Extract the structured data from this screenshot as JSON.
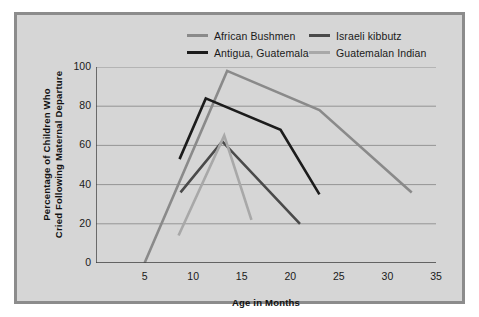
{
  "figure": {
    "background_color": "#d6d6d6",
    "border_color": "#8c8c8c",
    "page_color": "#ffffff"
  },
  "legend": {
    "position": "top-center",
    "entries": [
      {
        "label": "African Bushmen",
        "color": "#8a8a8a"
      },
      {
        "label": "Israeli kibbutz",
        "color": "#4a4a4a"
      },
      {
        "label": "Antigua, Guatemala",
        "color": "#1c1c1c"
      },
      {
        "label": "Guatemalan Indian",
        "color": "#a8a8a8"
      }
    ]
  },
  "axes": {
    "x": {
      "title": "Age in Months",
      "ticks": [
        "5",
        "10",
        "15",
        "20",
        "25",
        "30",
        "35"
      ],
      "min": 0,
      "max": 35
    },
    "y": {
      "title_line1": "Percentage of Children Who",
      "title_line2": "Cried Following Maternal Departure",
      "ticks": [
        "0",
        "20",
        "40",
        "60",
        "80",
        "100"
      ],
      "min": 0,
      "max": 100
    }
  },
  "chart_data": {
    "type": "line",
    "title": "",
    "xlabel": "Age in Months",
    "ylabel": "Percentage of Children Who Cried Following Maternal Departure",
    "xlim": [
      0,
      35
    ],
    "ylim": [
      0,
      100
    ],
    "xticks": [
      5,
      10,
      15,
      20,
      25,
      30,
      35
    ],
    "yticks": [
      0,
      20,
      40,
      60,
      80,
      100
    ],
    "grid": "horizontal",
    "legend_position": "top-center",
    "series": [
      {
        "name": "African Bushmen",
        "color": "#8a8a8a",
        "points": [
          {
            "x": 5,
            "y": 0
          },
          {
            "x": 13.5,
            "y": 98
          },
          {
            "x": 23,
            "y": 78
          },
          {
            "x": 32.5,
            "y": 36
          }
        ]
      },
      {
        "name": "Israeli kibbutz",
        "color": "#4a4a4a",
        "points": [
          {
            "x": 8.7,
            "y": 36
          },
          {
            "x": 13,
            "y": 62
          },
          {
            "x": 21,
            "y": 20
          }
        ]
      },
      {
        "name": "Antigua, Guatemala",
        "color": "#1c1c1c",
        "points": [
          {
            "x": 8.6,
            "y": 53
          },
          {
            "x": 11.3,
            "y": 84
          },
          {
            "x": 19,
            "y": 68
          },
          {
            "x": 23,
            "y": 35
          }
        ]
      },
      {
        "name": "Guatemalan Indian",
        "color": "#a8a8a8",
        "points": [
          {
            "x": 8.5,
            "y": 14
          },
          {
            "x": 13.2,
            "y": 65
          },
          {
            "x": 16,
            "y": 22
          }
        ]
      }
    ]
  }
}
